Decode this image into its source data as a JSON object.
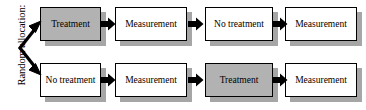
{
  "diagram": {
    "title_label": "Random allocation:",
    "type": "crossover-trial-flowchart",
    "colors": {
      "shaded_fill": "#b2b2b2",
      "plain_fill": "#ffffff",
      "shadow": "#a6a6a6",
      "stroke": "#000000",
      "background": "#ffffff"
    },
    "rows": [
      {
        "name": "sequence-a",
        "steps": [
          {
            "label": "Treatment",
            "style": "shaded"
          },
          {
            "label": "Measurement",
            "style": "plain"
          },
          {
            "label": "No treatment",
            "style": "plain"
          },
          {
            "label": "Measurement",
            "style": "plain"
          }
        ]
      },
      {
        "name": "sequence-b",
        "steps": [
          {
            "label": "No treatment",
            "style": "plain"
          },
          {
            "label": "Measurement",
            "style": "plain"
          },
          {
            "label": "Treatment",
            "style": "shaded"
          },
          {
            "label": "Measurement",
            "style": "plain"
          }
        ]
      }
    ],
    "allocation_arrow": {
      "name": "double-headed-allocation-arrow",
      "branches": [
        "up-to-sequence-a",
        "down-to-sequence-b"
      ]
    }
  }
}
